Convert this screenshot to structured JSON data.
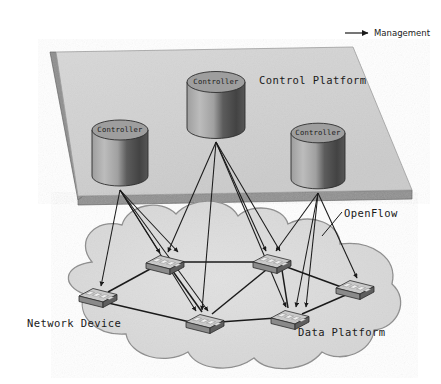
{
  "diagram": {
    "title_alt": "SDN architecture: control platform over data platform",
    "legend": {
      "management_label": "Management",
      "arrow_icon": "right-arrow-icon"
    },
    "labels": {
      "control_platform": "Control Platform",
      "data_platform": "Data Platform",
      "network_device": "Network Device",
      "openflow": "OpenFlow"
    },
    "controllers": [
      {
        "id": "controller-left",
        "label": "Controller",
        "cx": 120,
        "cy": 148
      },
      {
        "id": "controller-center",
        "label": "Controller",
        "cx": 216,
        "cy": 100
      },
      {
        "id": "controller-right",
        "label": "Controller",
        "cx": 318,
        "cy": 151
      }
    ],
    "switches": [
      {
        "id": "switch-left",
        "cx": 98,
        "cy": 296
      },
      {
        "id": "switch-top-left",
        "cx": 165,
        "cy": 263
      },
      {
        "id": "switch-top-right",
        "cx": 272,
        "cy": 262
      },
      {
        "id": "switch-bottom-mid",
        "cx": 205,
        "cy": 322
      },
      {
        "id": "switch-bottom-right",
        "cx": 290,
        "cy": 318
      },
      {
        "id": "switch-far-right",
        "cx": 355,
        "cy": 288
      }
    ],
    "colors": {
      "plane_fill": "#d2d2d2",
      "plane_edge": "#7d7d7d",
      "cloud_fill": "#dcdcdc",
      "cloud_stroke": "#8c8c8c",
      "cylinder_top": "#9a9a9a",
      "cylinder_light": "#b5b5b5",
      "cylinder_dark": "#4a4a4a",
      "switch_top": "#c9c9c9",
      "switch_side": "#6e6e6e",
      "line": "#1a1a1a",
      "text": "#1a1a1a"
    }
  }
}
